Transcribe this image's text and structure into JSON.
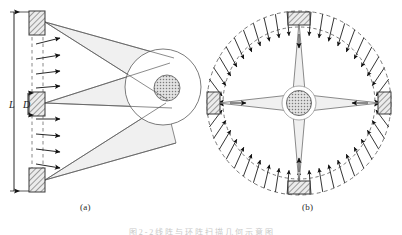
{
  "figure": {
    "caption": "图 2 - 2  线 阵 与 环 阵 扫 描 几 何 示 意 图",
    "panels": [
      {
        "id": "a",
        "label": "(a)",
        "name": "linear-array-panel",
        "description": "Linear array: three hatched transducer blocks on a vertical line emit fan beams toward a circular target; arrows point to the right.",
        "transducer_count": 3,
        "beam_count": 3,
        "arrow_count": 8,
        "arrow_direction": "right",
        "target_shape": "circle",
        "dimensions": [
          {
            "symbol": "L",
            "name": "array-length",
            "orientation": "vertical"
          },
          {
            "symbol": "D",
            "name": "element-spacing",
            "orientation": "vertical"
          }
        ]
      },
      {
        "id": "b",
        "label": "(b)",
        "name": "ring-array-panel",
        "description": "Ring array: four hatched transducer blocks at top, bottom, left and right of two concentric dashed circles; arrows point inward toward the central circular target.",
        "transducer_count": 4,
        "beam_count": 4,
        "arrow_count": 48,
        "arrow_direction": "inward",
        "target_shape": "circle",
        "dashed_circles": 2
      }
    ]
  },
  "colors": {
    "background": "#ffffff",
    "stroke": "#4a4a4a",
    "beam_fill": "#f0f0f0",
    "beam_stroke": "#5a5a5a",
    "block_fill": "#e8e8e8",
    "block_stroke": "#3a3a3a",
    "hatch": "#555555",
    "arrow": "#1a1a1a",
    "dashed": "#6a6a6a",
    "target_fill": "#b8b8b8",
    "text": "#1a1a1a"
  }
}
